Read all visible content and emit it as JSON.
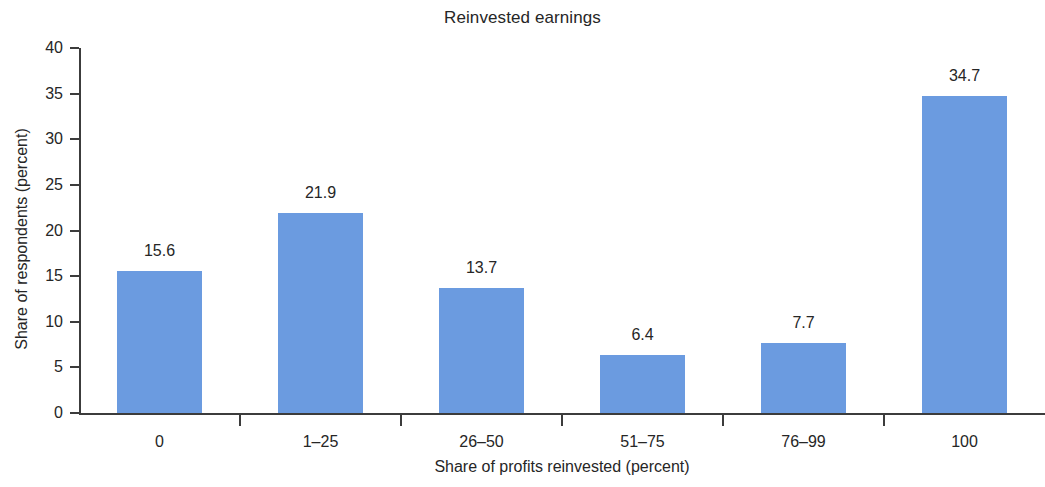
{
  "chart_data": {
    "type": "bar",
    "title": "Reinvested earnings",
    "xlabel": "Share of profits reinvested (percent)",
    "ylabel": "Share of respondents (percent)",
    "categories": [
      "0",
      "1–25",
      "26–50",
      "51–75",
      "76–99",
      "100"
    ],
    "values": [
      15.6,
      21.9,
      13.7,
      6.4,
      7.7,
      34.7
    ],
    "value_labels": [
      "15.6",
      "21.9",
      "13.7",
      "6.4",
      "7.7",
      "34.7"
    ],
    "ylim": [
      0,
      40
    ],
    "ytick_step": 5,
    "ytick_labels": [
      "0",
      "5",
      "10",
      "15",
      "20",
      "25",
      "30",
      "35",
      "40"
    ],
    "ytick_values": [
      0,
      5,
      10,
      15,
      20,
      25,
      30,
      35,
      40
    ],
    "grid": false,
    "legend": null,
    "bar_color": "#6b9be0",
    "axis_color": "#3c3c3c",
    "text_color": "#262626",
    "background_color": "#ffffff"
  }
}
